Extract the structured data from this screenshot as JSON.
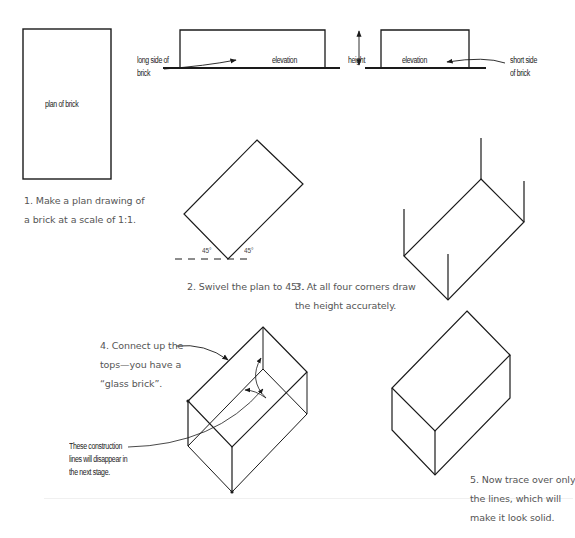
{
  "figure": {
    "plan": {
      "label": "plan of brick"
    },
    "elevation_long": {
      "callout_line1": "long side of",
      "callout_line2": "brick",
      "label": "elevation"
    },
    "height_marker": {
      "label": "height"
    },
    "elevation_short": {
      "label": "elevation",
      "callout_line1": "short side",
      "callout_line2": "of brick"
    },
    "angles": {
      "left": "45°",
      "right": "45°"
    },
    "construction_note": {
      "line1": "These construction",
      "line2": "lines will disappear in",
      "line3": "the next stage."
    },
    "steps": [
      {
        "number": "1",
        "line1": "1. Make a plan drawing of",
        "line2": "a brick at a scale of 1:1."
      },
      {
        "number": "2",
        "line1": "2. Swivel the plan to 45°."
      },
      {
        "number": "3",
        "line1": "3. At all four corners draw",
        "line2": "the height accurately."
      },
      {
        "number": "4",
        "line1": "4. Connect up the",
        "line2": "tops—you have a",
        "line3": "“glass brick”."
      },
      {
        "number": "5",
        "line1": "5. Now trace over only",
        "line2": "the lines, which will",
        "line3": "make it look solid."
      }
    ]
  },
  "colors": {
    "ink": "#1a1a1a",
    "caption": "#555555",
    "background": "#ffffff"
  }
}
